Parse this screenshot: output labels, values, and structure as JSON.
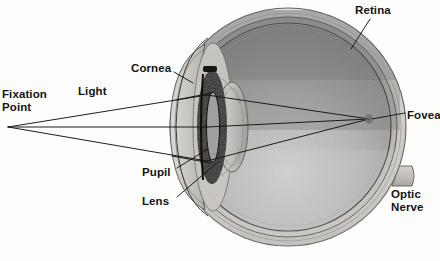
{
  "figure": {
    "background_color": "#fdfdfc",
    "line_color": "#1a1a1a"
  },
  "labels": [
    {
      "id": "fixation-point",
      "text": "Fixation\nPoint",
      "x": 2,
      "y": 88,
      "align": "left"
    },
    {
      "id": "light",
      "text": "Light",
      "x": 78,
      "y": 85,
      "align": "left"
    },
    {
      "id": "cornea",
      "text": "Cornea",
      "x": 131,
      "y": 62,
      "align": "left"
    },
    {
      "id": "retina",
      "text": "Retina",
      "x": 355,
      "y": 4,
      "align": "left"
    },
    {
      "id": "fovea",
      "text": "Fovea",
      "x": 407,
      "y": 109,
      "align": "left"
    },
    {
      "id": "optic-nerve",
      "text": "Optic\nNerve",
      "x": 391,
      "y": 188,
      "align": "left"
    },
    {
      "id": "pupil",
      "text": "Pupil",
      "x": 142,
      "y": 166,
      "align": "left"
    },
    {
      "id": "lens",
      "text": "Lens",
      "x": 142,
      "y": 195,
      "align": "left"
    }
  ],
  "anatomy": {
    "sclera_outer_color": "#d8d6d2",
    "sclera_band_color": "#c9c6c1",
    "vitreous_top_color": "#8e8e8e",
    "vitreous_bottom_color": "#c2c2c2",
    "iris_color": "#1c1a19",
    "lens_color": "#b9b7b3",
    "cornea_color": "#cfcdc9",
    "optic_nerve_color": "#c4c1bc"
  },
  "optics": {
    "fixation_point": {
      "x": 8,
      "y": 127
    },
    "fovea_point": {
      "x": 369,
      "y": 119
    },
    "ray_count": 3,
    "ray_entry_top": {
      "x": 205,
      "y": 95
    },
    "ray_entry_mid": {
      "x": 205,
      "y": 127
    },
    "ray_entry_bottom": {
      "x": 205,
      "y": 161
    }
  },
  "leaders": [
    {
      "id": "cornea-leader",
      "from": {
        "x": 174,
        "y": 72
      },
      "to": {
        "x": 192,
        "y": 82
      }
    },
    {
      "id": "retina-leader",
      "from": {
        "x": 369,
        "y": 18
      },
      "to": {
        "x": 350,
        "y": 47
      }
    },
    {
      "id": "fovea-leader",
      "from": {
        "x": 405,
        "y": 113
      },
      "to": {
        "x": 373,
        "y": 119
      }
    },
    {
      "id": "pupil-leader",
      "from": {
        "x": 176,
        "y": 168
      },
      "to": {
        "x": 206,
        "y": 150
      }
    },
    {
      "id": "lens-leader",
      "from": {
        "x": 176,
        "y": 197
      },
      "to": {
        "x": 216,
        "y": 163
      }
    }
  ]
}
